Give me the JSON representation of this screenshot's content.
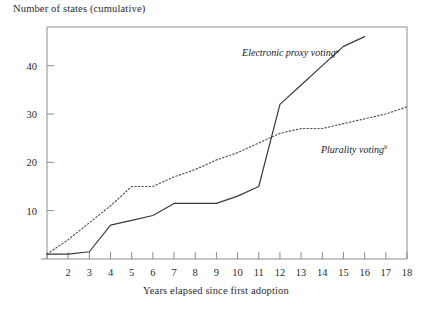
{
  "chart_data": {
    "type": "line",
    "title": "",
    "ylabel": "Number of states (cumulative)",
    "xlabel": "Years elapsed since first adoption",
    "xlim": [
      1,
      18
    ],
    "ylim": [
      0,
      48
    ],
    "xticks": [
      1,
      2,
      3,
      4,
      5,
      6,
      7,
      8,
      9,
      10,
      11,
      12,
      13,
      14,
      15,
      16,
      17,
      18
    ],
    "xticklabels": [
      "",
      "2",
      "3",
      "4",
      "5",
      "6",
      "7",
      "8",
      "9",
      "10",
      "11",
      "12",
      "13",
      "14",
      "15",
      "16",
      "17",
      "18"
    ],
    "yticks": [
      10,
      20,
      30,
      40
    ],
    "yticklabels": [
      "10",
      "20",
      "30",
      "40"
    ],
    "grid": false,
    "legend": "inline-annotations",
    "series": [
      {
        "name": "Electronic proxy voting",
        "footnote_marker": "a",
        "style": "solid",
        "color": "#3a3a3a",
        "x": [
          1,
          2,
          3,
          4,
          5,
          6,
          7,
          8,
          9,
          10,
          11,
          12,
          13,
          14,
          15,
          16
        ],
        "values": [
          1,
          1,
          1.5,
          7,
          8,
          9,
          11.5,
          11.5,
          11.5,
          13,
          15,
          32,
          36,
          40,
          44,
          46
        ],
        "label_x": 12.5,
        "label_y": 42
      },
      {
        "name": "Plurality voting",
        "footnote_marker": "b",
        "style": "dotted",
        "color": "#555555",
        "x": [
          1,
          2,
          3,
          4,
          5,
          6,
          7,
          8,
          9,
          10,
          11,
          12,
          13,
          14,
          15,
          16,
          17,
          18
        ],
        "values": [
          1,
          4,
          7.5,
          11,
          15,
          15,
          17,
          18.5,
          20.5,
          22,
          24,
          26,
          27,
          27,
          28,
          29,
          30,
          31.5
        ],
        "label_x": 15.5,
        "label_y": 22
      }
    ]
  },
  "annotations": {
    "electronic_proxy_label": "Electronic proxy voting",
    "electronic_proxy_sup": "a",
    "plurality_label": "Plurality voting",
    "plurality_sup": "b"
  },
  "axes": {
    "y_title": "Number of states (cumulative)",
    "x_title": "Years elapsed since first adoption"
  },
  "colors": {
    "frame": "#8c8c8c",
    "solid_series": "#3a3a3a",
    "dotted_series": "#555555",
    "text": "#2b2b2b"
  }
}
